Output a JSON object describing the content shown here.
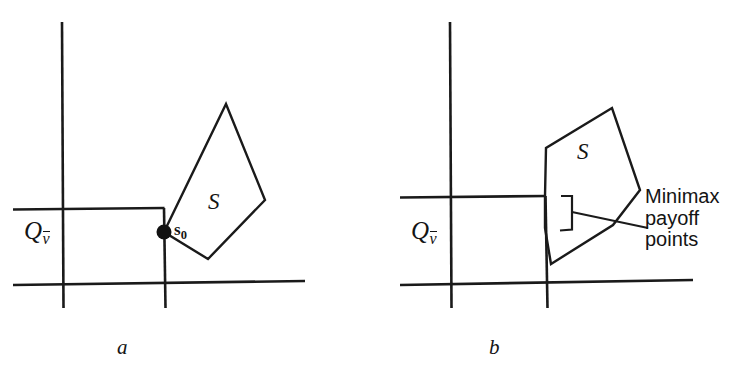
{
  "figure": {
    "width": 741,
    "height": 379,
    "background": "#ffffff",
    "stroke_color": "#1a1a1a",
    "text_color": "#141414"
  },
  "panels": [
    {
      "id": "a",
      "caption": "a",
      "region_label_base": "Q",
      "region_label_sub": "v",
      "region_label_overbar": true,
      "set_label": "S",
      "point_label_base": "s",
      "point_label_sub": "0",
      "description": "Convex set S touches the boundary corner of the region Q-vbar at the single minimax payoff point s0"
    },
    {
      "id": "b",
      "caption": "b",
      "region_label_base": "Q",
      "region_label_sub": "v",
      "region_label_overbar": true,
      "set_label": "S",
      "callout_lines": [
        "Minimax",
        "payoff",
        "points"
      ],
      "description": "Convex set S overlaps the corner of region Q-vbar along a face; the bracketed segment marks a set of minimax payoff points"
    }
  ],
  "geometry": {
    "panel_a": {
      "vertical_axis_left": {
        "x1": 62,
        "y1": 22,
        "x2": 63,
        "y2": 308
      },
      "vertical_axis_right": {
        "x1": 163,
        "y1": 208,
        "x2": 165,
        "y2": 308
      },
      "horizontal_axis_bottom": {
        "x1": 13,
        "y1": 285,
        "x2": 305,
        "y2": 281
      },
      "horizontal_axis_upper": {
        "x1": 13,
        "y1": 209,
        "x2": 164,
        "y2": 208
      },
      "set_polygon": [
        [
          164,
          232
        ],
        [
          226,
          104
        ],
        [
          265,
          200
        ],
        [
          208,
          259
        ]
      ],
      "point_dot": {
        "cx": 164,
        "cy": 232,
        "r": 7.5
      }
    },
    "panel_b": {
      "vertical_axis_left": {
        "x1": 450,
        "y1": 22,
        "x2": 451,
        "y2": 308
      },
      "vertical_axis_right": {
        "x1": 545,
        "y1": 196,
        "x2": 547,
        "y2": 308
      },
      "horizontal_axis_bottom": {
        "x1": 400,
        "y1": 285,
        "x2": 693,
        "y2": 280
      },
      "horizontal_axis_upper": {
        "x1": 400,
        "y1": 197,
        "x2": 546,
        "y2": 196
      },
      "set_polygon": [
        [
          545,
          196
        ],
        [
          546,
          148
        ],
        [
          612,
          108
        ],
        [
          640,
          190
        ],
        [
          613,
          225
        ],
        [
          551,
          264
        ],
        [
          545,
          228
        ]
      ],
      "bracket": [
        [
          561,
          196
        ],
        [
          572,
          196
        ],
        [
          572,
          229
        ],
        [
          560,
          230
        ]
      ],
      "leader_from": [
        572,
        212
      ],
      "leader_to": [
        648,
        228
      ]
    }
  },
  "labels": {
    "panel_a_region": {
      "x": 24,
      "y": 224
    },
    "panel_a_set": {
      "x": 208,
      "y": 198
    },
    "panel_a_point": {
      "x": 174,
      "y": 223
    },
    "panel_a_caption": {
      "x": 117,
      "y": 345
    },
    "panel_b_region": {
      "x": 411,
      "y": 224
    },
    "panel_b_set": {
      "x": 577,
      "y": 148
    },
    "panel_b_callout": {
      "x": 645,
      "y": 185
    },
    "panel_b_caption": {
      "x": 489,
      "y": 345
    }
  }
}
